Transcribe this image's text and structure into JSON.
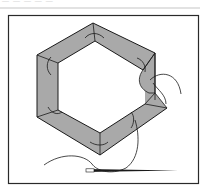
{
  "caption": {
    "text": "— — — — —"
  },
  "illustration": {
    "subject": "hexagon-patchwork-sewing",
    "fill_color": "#a9a9a9",
    "line_color": "#1a1a1a",
    "frame_color": "#2a2a2a"
  }
}
